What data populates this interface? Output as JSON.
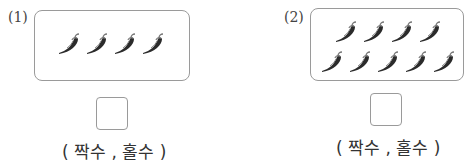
{
  "problems": [
    {
      "label": "(1)",
      "count": 4,
      "rows": [
        4
      ],
      "choices": "( 짝수 , 홀수 )"
    },
    {
      "label": "(2)",
      "count": 9,
      "rows": [
        4,
        5
      ],
      "choices": "( 짝수 , 홀수 )"
    }
  ],
  "icon": "chili-pepper-icon"
}
